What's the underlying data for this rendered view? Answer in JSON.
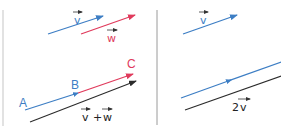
{
  "colors": {
    "blue": "#3d7ec4",
    "red": "#e03a5c",
    "black": "#2b2b2b",
    "divider": "#9a9a9a",
    "edge": "#d8d8d8"
  },
  "left_panel": {
    "top_vectors": [
      {
        "name": "v",
        "label": "v",
        "color": "blue"
      },
      {
        "name": "w",
        "label": "w",
        "color": "red"
      }
    ],
    "points": {
      "A": "A",
      "B": "B",
      "C": "C"
    },
    "sum_label": {
      "v": "v",
      "plus": "+",
      "w": "w"
    }
  },
  "right_panel": {
    "top_vector_label": "v",
    "double_label_coef": "2",
    "double_label_var": "v"
  }
}
